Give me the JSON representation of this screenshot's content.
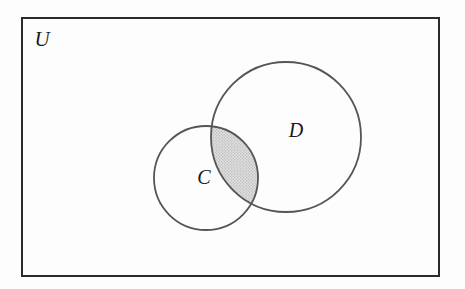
{
  "diagram": {
    "type": "venn",
    "title": "",
    "background_color": "#fdfdfd",
    "universe": {
      "label": "U",
      "name": "universal-set",
      "border_color": "#2b2b2b",
      "border_width": 2,
      "x": 21,
      "y": 17,
      "width": 419,
      "height": 260
    },
    "sets": [
      {
        "label": "C",
        "name": "set-c",
        "cx": 206,
        "cy": 178,
        "r": 52,
        "stroke_color": "#555555",
        "stroke_width": 1.8,
        "fill": "none",
        "label_x": 204,
        "label_y": 179
      },
      {
        "label": "D",
        "name": "set-d",
        "cx": 286,
        "cy": 137,
        "r": 75,
        "stroke_color": "#555555",
        "stroke_width": 1.8,
        "fill": "none",
        "label_x": 296,
        "label_y": 132
      }
    ],
    "shaded_region": {
      "name": "intersection-c-and-d",
      "description": "C intersect D",
      "fill_color": "#d9d9d9",
      "pattern": "stipple",
      "intersection_points": [
        {
          "x": 218,
          "y": 128
        },
        {
          "x": 248,
          "y": 202
        }
      ]
    },
    "universe_label_position": {
      "x": 42,
      "y": 41
    }
  }
}
